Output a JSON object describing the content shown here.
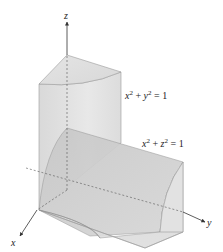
{
  "figure": {
    "axes": {
      "x_label": "x",
      "y_label": "y",
      "z_label": "z"
    },
    "surfaces": [
      {
        "name": "vertical-cylinder",
        "equation_lhs_a": "x",
        "equation_lhs_b": "y",
        "equation_rhs": "1",
        "equation": "x² + y² = 1"
      },
      {
        "name": "horizontal-cylinder",
        "equation_lhs_a": "x",
        "equation_lhs_b": "z",
        "equation_rhs": "1",
        "equation": "x² + z² = 1"
      }
    ],
    "colors": {
      "solid_light": "#e6e6e6",
      "solid_mid": "#d2d2d2",
      "solid_dark": "#bdbdbd",
      "edge": "#8a8a8a",
      "axis": "#333333"
    }
  }
}
